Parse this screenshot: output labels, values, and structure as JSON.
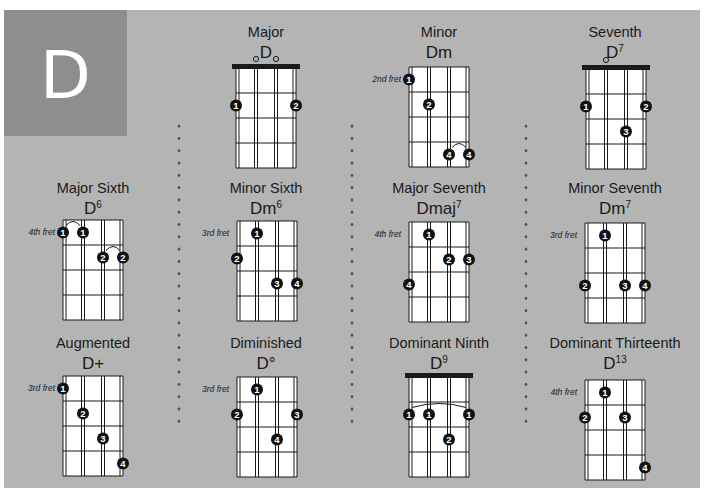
{
  "page": {
    "key_letter": "D",
    "colors": {
      "panel": "#b4b4b4",
      "letter_box": "#8e8e8e",
      "letter": "#ffffff",
      "fretboard": "#ffffff",
      "lines": "#1a1a1a",
      "dot": "#111111",
      "dot_text": "#ffffff"
    }
  },
  "chords": [
    {
      "type": "Major",
      "name": "D",
      "sup": "",
      "fret_label": "",
      "nut": true,
      "open_strings": [
        1,
        2
      ],
      "fingers": [
        {
          "string": 0,
          "fret": 2,
          "finger": "1"
        },
        {
          "string": 3,
          "fret": 2,
          "finger": "2"
        }
      ],
      "barres": []
    },
    {
      "type": "Minor",
      "name": "Dm",
      "sup": "",
      "fret_label": "2nd fret",
      "nut": false,
      "open_strings": [],
      "fingers": [
        {
          "string": 0,
          "fret": 1,
          "finger": "1"
        },
        {
          "string": 1,
          "fret": 2,
          "finger": "2"
        },
        {
          "string": 2,
          "fret": 4,
          "finger": "4"
        },
        {
          "string": 3,
          "fret": 4,
          "finger": "4"
        }
      ],
      "barres": [
        {
          "from": 2,
          "to": 3,
          "fret": 4
        }
      ]
    },
    {
      "type": "Seventh",
      "name": "D",
      "sup": "7",
      "fret_label": "",
      "nut": true,
      "open_strings": [
        1
      ],
      "fingers": [
        {
          "string": 0,
          "fret": 2,
          "finger": "1"
        },
        {
          "string": 3,
          "fret": 2,
          "finger": "2"
        },
        {
          "string": 2,
          "fret": 3,
          "finger": "3"
        }
      ],
      "barres": []
    },
    {
      "type": "Major Sixth",
      "name": "D",
      "sup": "6",
      "fret_label": "4th fret",
      "nut": false,
      "open_strings": [],
      "fingers": [
        {
          "string": 0,
          "fret": 1,
          "finger": "1"
        },
        {
          "string": 1,
          "fret": 1,
          "finger": "1"
        },
        {
          "string": 2,
          "fret": 2,
          "finger": "2"
        },
        {
          "string": 3,
          "fret": 2,
          "finger": "2"
        }
      ],
      "barres": [
        {
          "from": 0,
          "to": 1,
          "fret": 1
        },
        {
          "from": 2,
          "to": 3,
          "fret": 2
        }
      ]
    },
    {
      "type": "Minor Sixth",
      "name": "Dm",
      "sup": "6",
      "fret_label": "3rd fret",
      "nut": false,
      "open_strings": [],
      "fingers": [
        {
          "string": 1,
          "fret": 1,
          "finger": "1"
        },
        {
          "string": 0,
          "fret": 2,
          "finger": "2"
        },
        {
          "string": 2,
          "fret": 3,
          "finger": "3"
        },
        {
          "string": 3,
          "fret": 3,
          "finger": "4"
        }
      ],
      "barres": []
    },
    {
      "type": "Major Seventh",
      "name": "Dmaj",
      "sup": "7",
      "fret_label": "4th fret",
      "nut": false,
      "open_strings": [],
      "fingers": [
        {
          "string": 1,
          "fret": 1,
          "finger": "1"
        },
        {
          "string": 2,
          "fret": 2,
          "finger": "2"
        },
        {
          "string": 3,
          "fret": 2,
          "finger": "3"
        },
        {
          "string": 0,
          "fret": 3,
          "finger": "4"
        }
      ],
      "barres": []
    },
    {
      "type": "Minor Seventh",
      "name": "Dm",
      "sup": "7",
      "fret_label": "3rd fret",
      "nut": false,
      "open_strings": [],
      "fingers": [
        {
          "string": 1,
          "fret": 1,
          "finger": "1"
        },
        {
          "string": 0,
          "fret": 3,
          "finger": "2"
        },
        {
          "string": 2,
          "fret": 3,
          "finger": "3"
        },
        {
          "string": 3,
          "fret": 3,
          "finger": "4"
        }
      ],
      "barres": []
    },
    {
      "type": "Augmented",
      "name": "D+",
      "sup": "",
      "fret_label": "3rd fret",
      "nut": false,
      "open_strings": [],
      "fingers": [
        {
          "string": 0,
          "fret": 1,
          "finger": "1"
        },
        {
          "string": 1,
          "fret": 2,
          "finger": "2"
        },
        {
          "string": 2,
          "fret": 3,
          "finger": "3"
        },
        {
          "string": 3,
          "fret": 4,
          "finger": "4"
        }
      ],
      "barres": []
    },
    {
      "type": "Diminished",
      "name": "D°",
      "sup": "",
      "fret_label": "3rd fret",
      "nut": false,
      "open_strings": [],
      "fingers": [
        {
          "string": 1,
          "fret": 1,
          "finger": "1"
        },
        {
          "string": 0,
          "fret": 2,
          "finger": "2"
        },
        {
          "string": 3,
          "fret": 2,
          "finger": "3"
        },
        {
          "string": 2,
          "fret": 3,
          "finger": "4"
        }
      ],
      "barres": []
    },
    {
      "type": "Dominant Ninth",
      "name": "D",
      "sup": "9",
      "fret_label": "",
      "nut": true,
      "open_strings": [],
      "fingers": [
        {
          "string": 0,
          "fret": 2,
          "finger": "1"
        },
        {
          "string": 1,
          "fret": 2,
          "finger": "1"
        },
        {
          "string": 3,
          "fret": 2,
          "finger": "1"
        },
        {
          "string": 2,
          "fret": 3,
          "finger": "2"
        }
      ],
      "barres": [
        {
          "from": 0,
          "to": 3,
          "fret": 2
        }
      ]
    },
    {
      "type": "Dominant Thirteenth",
      "name": "D",
      "sup": "13",
      "fret_label": "4th fret",
      "nut": false,
      "open_strings": [],
      "fingers": [
        {
          "string": 1,
          "fret": 1,
          "finger": "1"
        },
        {
          "string": 0,
          "fret": 2,
          "finger": "2"
        },
        {
          "string": 2,
          "fret": 2,
          "finger": "3"
        },
        {
          "string": 3,
          "fret": 4,
          "finger": "4"
        }
      ],
      "barres": []
    }
  ]
}
